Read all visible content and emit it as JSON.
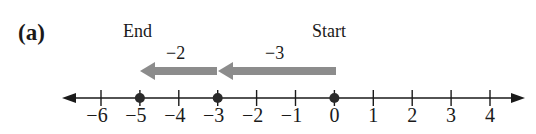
{
  "part_label": "(a)",
  "endpoint_labels": {
    "end": "End",
    "start": "Start"
  },
  "jumps": [
    {
      "label": "−3",
      "from": 0,
      "to": -3
    },
    {
      "label": "−2",
      "from": -3,
      "to": -5
    }
  ],
  "number_line": {
    "min": -6,
    "max": 4,
    "ticks": [
      "−6",
      "−5",
      "−4",
      "−3",
      "−2",
      "−1",
      "0",
      "1",
      "2",
      "3",
      "4"
    ],
    "points": [
      -5,
      -3,
      0
    ],
    "start": 0,
    "end": -5
  },
  "colors": {
    "line": "#1a1a1a",
    "arrow": "#8c8c8c",
    "dot": "#2a2a2a"
  }
}
